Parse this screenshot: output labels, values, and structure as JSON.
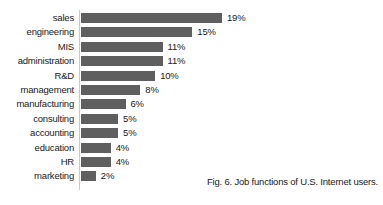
{
  "chart_data": {
    "type": "bar",
    "orientation": "horizontal",
    "title": "",
    "xlabel": "",
    "ylabel": "",
    "grid": false,
    "legend": false,
    "xlim": [
      0,
      20
    ],
    "value_suffix": "%",
    "categories": [
      "sales",
      "engineering",
      "MIS",
      "administration",
      "R&D",
      "management",
      "manufacturing",
      "consulting",
      "accounting",
      "education",
      "HR",
      "marketing"
    ],
    "values": [
      19,
      15,
      11,
      11,
      10,
      8,
      6,
      5,
      5,
      4,
      4,
      2
    ],
    "value_labels": [
      "19%",
      "15%",
      "11%",
      "11%",
      "10%",
      "8%",
      "6%",
      "5%",
      "5%",
      "4%",
      "4%",
      "2%"
    ],
    "bar_color": "#5f5f5f",
    "background_color": "#ffffff",
    "text_color": "#1a1a1a",
    "axis_color": "#c9c9c9"
  },
  "caption": {
    "text": "Fig. 6. Job functions of U.S. Internet users."
  }
}
